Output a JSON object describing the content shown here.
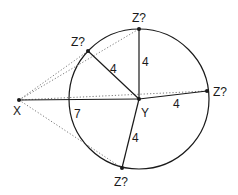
{
  "diagram": {
    "circle": {
      "cx": 139,
      "cy": 99,
      "r": 70,
      "stroke": "#1a1a1a"
    },
    "points": {
      "X": {
        "label": "X",
        "x": 19,
        "y": 100
      },
      "Y": {
        "label": "Y",
        "x": 139,
        "y": 99
      },
      "Z_top": {
        "label": "Z?",
        "x": 139,
        "y": 29
      },
      "Z_upper_left": {
        "label": "Z?",
        "x": 88,
        "y": 51
      },
      "Z_right": {
        "label": "Z?",
        "x": 207,
        "y": 91
      },
      "Z_bottom": {
        "label": "Z?",
        "x": 122,
        "y": 168
      }
    },
    "segment_labels": {
      "XY": "7",
      "Y_Z_top": "4",
      "Y_Z_upper_left": "4",
      "Y_Z_right": "4",
      "Y_Z_bottom": "4"
    },
    "line_color": "#1a1a1a",
    "dotted_color": "#7a7a7a"
  }
}
